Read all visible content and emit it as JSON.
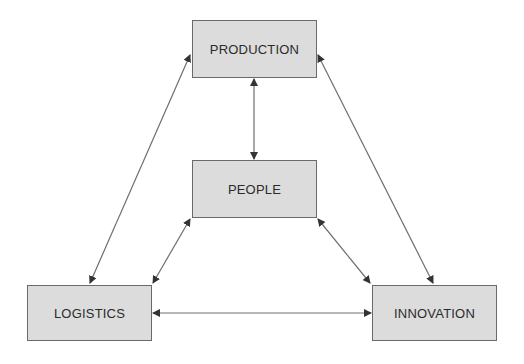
{
  "diagram": {
    "nodes": [
      {
        "id": "production",
        "label": "PRODUCTION",
        "x": 192,
        "y": 20,
        "w": 125,
        "h": 58
      },
      {
        "id": "people",
        "label": "PEOPLE",
        "x": 192,
        "y": 160,
        "w": 125,
        "h": 58
      },
      {
        "id": "logistics",
        "label": "LOGISTICS",
        "x": 27,
        "y": 285,
        "w": 125,
        "h": 56
      },
      {
        "id": "innovation",
        "label": "INNOVATION",
        "x": 372,
        "y": 285,
        "w": 125,
        "h": 56
      }
    ],
    "edges": [
      {
        "from": "production",
        "to": "people",
        "bidirectional": true
      },
      {
        "from": "production",
        "to": "logistics",
        "bidirectional": true
      },
      {
        "from": "production",
        "to": "innovation",
        "bidirectional": true
      },
      {
        "from": "people",
        "to": "logistics",
        "bidirectional": true
      },
      {
        "from": "people",
        "to": "innovation",
        "bidirectional": true
      },
      {
        "from": "logistics",
        "to": "innovation",
        "bidirectional": true
      }
    ],
    "colors": {
      "box_fill": "#dcdcdc",
      "box_border": "#6a6a6a",
      "line": "#6e6e6e",
      "text": "#2b2b2b"
    }
  }
}
